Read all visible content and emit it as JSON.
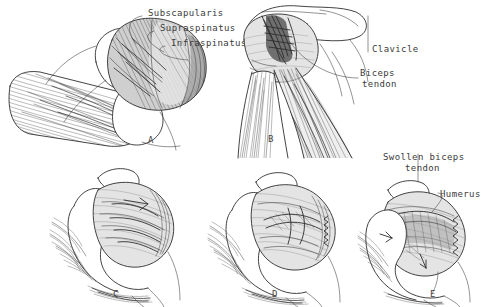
{
  "figure": {
    "background_color": "#ffffff",
    "ink_color": "#2e2e2e",
    "width": 496,
    "height": 307
  },
  "panels": [
    {
      "id": "A",
      "letter": "A",
      "caption": "Superior view of humeral head with rotator cuff insertions",
      "letter_x": 148,
      "letter_y": 141
    },
    {
      "id": "B",
      "letter": "B",
      "caption": "Anterior view of shoulder with clavicle and biceps tendon",
      "letter_x": 268,
      "letter_y": 140
    },
    {
      "id": "C",
      "letter": "C",
      "caption": "Lateral shoulder stage one",
      "letter_x": 113,
      "letter_y": 295
    },
    {
      "id": "D",
      "letter": "D",
      "caption": "Lateral shoulder stage two",
      "letter_x": 272,
      "letter_y": 295
    },
    {
      "id": "E",
      "letter": "E",
      "caption": "Lateral shoulder stage three with swollen biceps tendon",
      "letter_x": 430,
      "letter_y": 295
    }
  ],
  "labels": [
    {
      "id": "subscapularis",
      "text": "Subscapularis",
      "x": 144,
      "y": 12,
      "align": "left"
    },
    {
      "id": "supraspinatus",
      "text": "Supraspinatus",
      "x": 156,
      "y": 27,
      "align": "left"
    },
    {
      "id": "infraspinatus",
      "text": "Infraspinatus",
      "x": 167,
      "y": 42,
      "align": "left"
    },
    {
      "id": "clavicle",
      "text": "Clavicle",
      "x": 372,
      "y": 48,
      "align": "left"
    },
    {
      "id": "biceps-tendon",
      "text": "Biceps",
      "x": 360,
      "y": 72,
      "align": "left"
    },
    {
      "id": "biceps-tendon-2",
      "text": "tendon",
      "x": 362,
      "y": 83,
      "align": "left"
    },
    {
      "id": "swollen-biceps-tendon",
      "text": "Swollen biceps",
      "x": 383,
      "y": 152,
      "align": "left"
    },
    {
      "id": "swollen-biceps-tendon-2",
      "text": "tendon",
      "x": 405,
      "y": 163,
      "align": "left"
    },
    {
      "id": "humerus",
      "text": "Humerus",
      "x": 440,
      "y": 193,
      "align": "left"
    }
  ]
}
